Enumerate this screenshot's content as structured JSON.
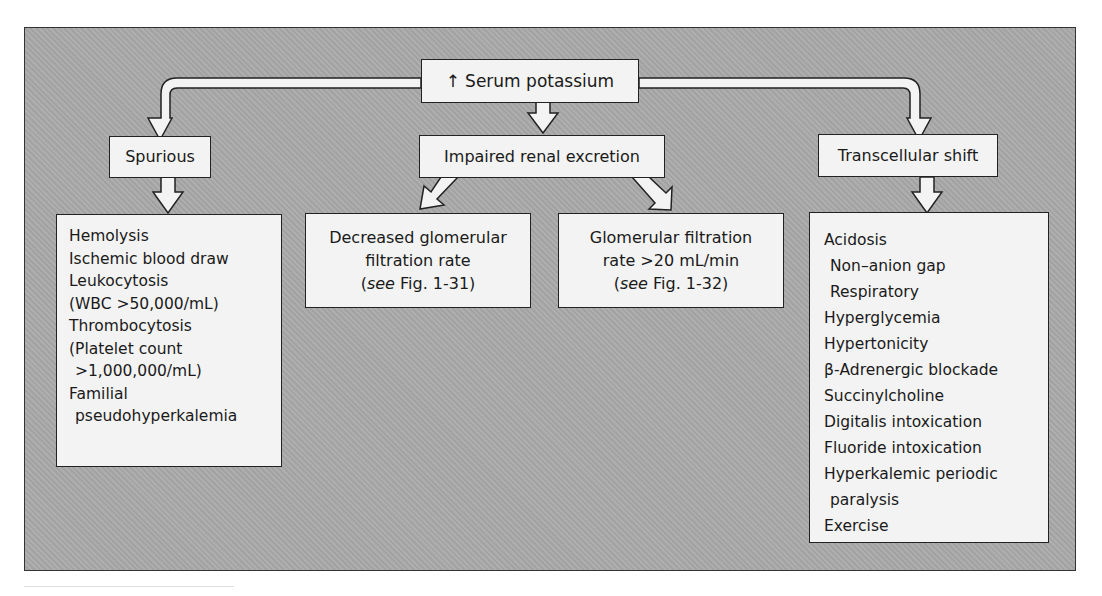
{
  "diagram": {
    "type": "flowchart",
    "background_color": "#a9a9a9",
    "box_color": "#f3f3f3",
    "root": {
      "arrow_glyph": "↑",
      "label": "Serum potassium"
    },
    "categories": [
      {
        "id": "spurious",
        "label": "Spurious",
        "items": [
          {
            "text": "Hemolysis",
            "indent": false
          },
          {
            "text": "Ischemic blood draw",
            "indent": false
          },
          {
            "text": "Leukocytosis",
            "indent": false
          },
          {
            "text": "(WBC >50,000/mL)",
            "indent": false
          },
          {
            "text": "Thrombocytosis",
            "indent": false
          },
          {
            "text": "(Platelet count",
            "indent": false
          },
          {
            "text": ">1,000,000/mL)",
            "indent": true
          },
          {
            "text": "Familial",
            "indent": false
          },
          {
            "text": "pseudohyperkalemia",
            "indent": true
          }
        ]
      },
      {
        "id": "impaired-renal",
        "label": "Impaired renal excretion",
        "children": [
          {
            "line1": "Decreased glomerular",
            "line2": "filtration rate",
            "ref_see": "see",
            "ref_fig": " Fig. 1-31)",
            "ref_open": "("
          },
          {
            "line1": "Glomerular filtration",
            "line2": "rate >20 mL/min",
            "ref_see": "see",
            "ref_fig": " Fig. 1-32)",
            "ref_open": "("
          }
        ]
      },
      {
        "id": "transcellular",
        "label": "Transcellular shift",
        "items": [
          {
            "text": "Acidosis",
            "indent": false
          },
          {
            "text": "Non–anion gap",
            "indent": true
          },
          {
            "text": "Respiratory",
            "indent": true
          },
          {
            "text": "Hyperglycemia",
            "indent": false
          },
          {
            "text": "Hypertonicity",
            "indent": false
          },
          {
            "text": "β-Adrenergic blockade",
            "indent": false
          },
          {
            "text": "Succinylcholine",
            "indent": false
          },
          {
            "text": "Digitalis intoxication",
            "indent": false
          },
          {
            "text": "Fluoride intoxication",
            "indent": false
          },
          {
            "text": "Hyperkalemic periodic",
            "indent": false
          },
          {
            "text": "paralysis",
            "indent": true
          },
          {
            "text": "Exercise",
            "indent": false
          }
        ]
      }
    ]
  }
}
